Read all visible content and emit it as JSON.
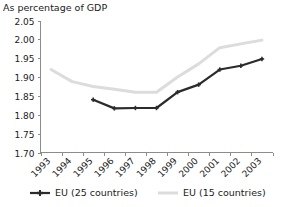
{
  "chart_data": {
    "type": "line",
    "title": "As percentage of GDP",
    "subtitle": "",
    "xlabel": "",
    "ylabel": "",
    "categories": [
      "1993",
      "1994",
      "1995",
      "1996",
      "1997",
      "1998",
      "1999",
      "2000",
      "2001",
      "2002",
      "2003"
    ],
    "x": [
      1993,
      1994,
      1995,
      1996,
      1997,
      1998,
      1999,
      2000,
      2001,
      2002,
      2003
    ],
    "ylim": [
      1.7,
      2.05
    ],
    "yticks": [
      "1.70",
      "1.75",
      "1.80",
      "1.85",
      "1.90",
      "1.95",
      "2.00",
      "2.05"
    ],
    "ytick_values": [
      1.7,
      1.75,
      1.8,
      1.85,
      1.9,
      1.95,
      2.0,
      2.05
    ],
    "grid": false,
    "legend_position": "bottom",
    "xtick_rotation": 45,
    "series": [
      {
        "name": "EU (25 countries)",
        "color": "#2b2b2b",
        "marker": "plus",
        "values": [
          null,
          null,
          1.84,
          1.817,
          1.818,
          1.818,
          1.86,
          1.88,
          1.92,
          1.93,
          1.948
        ]
      },
      {
        "name": "EU (15 countries)",
        "color": "#dcdcdc",
        "marker": "none",
        "values": [
          1.92,
          1.888,
          1.875,
          1.868,
          1.86,
          1.86,
          1.9,
          1.935,
          1.978,
          1.988,
          1.998
        ]
      }
    ]
  },
  "legend": {
    "entries": [
      {
        "label": "EU (25 countries)",
        "color": "#2b2b2b"
      },
      {
        "label": "EU (15 countries)",
        "color": "#dcdcdc"
      }
    ]
  },
  "colors": {
    "axis": "#8c8c8c",
    "text": "#1a1a1a",
    "background": "#ffffff",
    "series_dark": "#2b2b2b",
    "series_light": "#dcdcdc"
  }
}
